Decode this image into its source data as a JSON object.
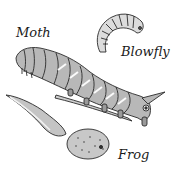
{
  "diagram": {
    "labels": {
      "moth": "Moth",
      "blowfly": "Blowfly",
      "frog": "Frog"
    },
    "items": [
      {
        "name": "moth",
        "label": "Moth",
        "depiction": "caterpillar on twig"
      },
      {
        "name": "blowfly",
        "label": "Blowfly",
        "depiction": "maggot"
      },
      {
        "name": "frog",
        "label": "Frog",
        "depiction": "tadpole"
      }
    ]
  },
  "colors": {
    "background": "#ffffff",
    "ink": "#2a2a2a",
    "shade": "#9a9a9a",
    "light": "#d6d6d6"
  }
}
